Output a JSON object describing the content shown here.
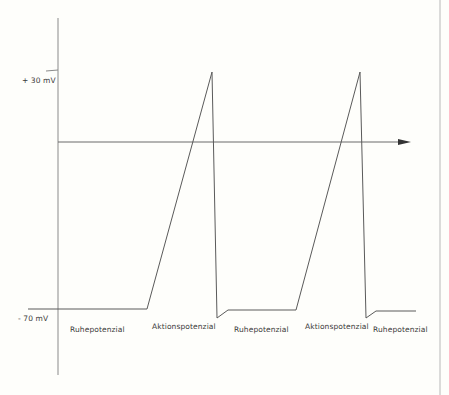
{
  "diagram": {
    "title": "Aktionspotenzial",
    "y_axis": {
      "ticks": [
        {
          "label": "+ 30 mV",
          "value": 30
        },
        {
          "label": "- 70 mV",
          "value": -70
        }
      ]
    },
    "phases": [
      {
        "label": "Ruhepotenzial"
      },
      {
        "label": "Aktionspotenzial"
      },
      {
        "label": "Ruhepotenzial"
      },
      {
        "label": "Aktionspotenzial"
      },
      {
        "label": "Ruhepotenzial"
      }
    ],
    "colors": {
      "background": "#fefefb",
      "line": "#5a5a5a",
      "axis": "#7a7a7a",
      "text": "#3a3a3a"
    }
  }
}
